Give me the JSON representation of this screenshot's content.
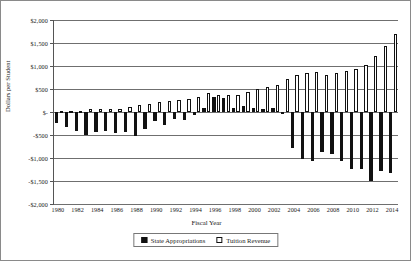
{
  "chart_data": {
    "type": "bar",
    "title": "",
    "xlabel": "Fiscal Year",
    "ylabel": "Dollars per Student",
    "ylim": [
      -2000,
      2000
    ],
    "ytick_values": [
      2000,
      1500,
      1000,
      500,
      0,
      -500,
      -1000,
      -1500,
      -2000
    ],
    "ytick_labels": [
      "$2,000",
      "$1,500",
      "$1,000",
      "$500",
      "$-",
      "-$500",
      "-$1,000",
      "-$1,500",
      "-$2,000"
    ],
    "grid": true,
    "legend_position": "bottom",
    "categories": [
      "1980",
      "1981",
      "1982",
      "1983",
      "1984",
      "1985",
      "1986",
      "1987",
      "1988",
      "1989",
      "1990",
      "1991",
      "1992",
      "1993",
      "1994",
      "1995",
      "1996",
      "1997",
      "1998",
      "1999",
      "2000",
      "2001",
      "2002",
      "2003",
      "2004",
      "2005",
      "2006",
      "2007",
      "2008",
      "2009",
      "2010",
      "2011",
      "2012",
      "2013",
      "2014"
    ],
    "xtick_labels": [
      "1980",
      "1982",
      "1984",
      "1986",
      "1988",
      "1990",
      "1992",
      "1994",
      "1996",
      "1998",
      "2000",
      "2002",
      "2004",
      "2006",
      "2008",
      "2010",
      "2012",
      "2014"
    ],
    "series": [
      {
        "name": "State Appropriations",
        "color": "#111111",
        "fill": "solid",
        "values": [
          -235,
          -330,
          -415,
          -505,
          -430,
          -420,
          -460,
          -445,
          -520,
          -360,
          -190,
          -275,
          -150,
          -170,
          -60,
          95,
          330,
          315,
          85,
          130,
          80,
          60,
          85,
          -35,
          -790,
          -1015,
          -1070,
          -870,
          -905,
          -1075,
          -1230,
          -1235,
          -1500,
          -1275,
          -1330
        ]
      },
      {
        "name": "Tuition Revenue",
        "color": "#ffffff",
        "fill": "outline",
        "values": [
          15,
          20,
          30,
          55,
          55,
          65,
          70,
          110,
          155,
          170,
          220,
          245,
          260,
          290,
          320,
          420,
          380,
          370,
          370,
          445,
          500,
          545,
          580,
          720,
          810,
          840,
          865,
          800,
          855,
          900,
          935,
          1030,
          1210,
          1430,
          1690
        ]
      }
    ]
  },
  "legend": {
    "items": [
      {
        "label": "State Appropriations"
      },
      {
        "label": "Tuition Revenue"
      }
    ]
  }
}
